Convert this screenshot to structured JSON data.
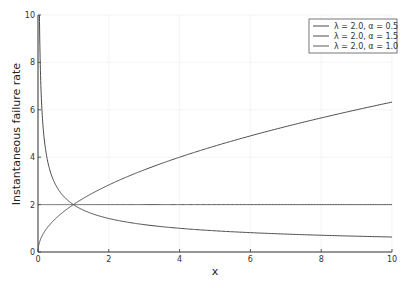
{
  "chart_data": {
    "type": "line",
    "title": "",
    "xlabel": "x",
    "ylabel": "Instantaneous failure rate",
    "xlim": [
      0,
      10
    ],
    "ylim": [
      0,
      10
    ],
    "xticks": [
      0,
      2,
      4,
      6,
      8,
      10
    ],
    "yticks": [
      0,
      2,
      4,
      6,
      8,
      10
    ],
    "grid": true,
    "legend_position": "top-right",
    "formula": "lambda * x^(alpha - 1)",
    "series": [
      {
        "name": "λ = 2.0, α = 0.5",
        "lambda": 2.0,
        "alpha": 0.5,
        "color": "#4a4a4a",
        "x": [
          0.04,
          0.1,
          0.2,
          0.4,
          0.6,
          0.8,
          1,
          1.5,
          2,
          3,
          4,
          5,
          6,
          7,
          8,
          9,
          10
        ],
        "y": [
          10,
          6.32,
          4.47,
          3.16,
          2.58,
          2.24,
          2.0,
          1.63,
          1.41,
          1.15,
          1.0,
          0.89,
          0.82,
          0.76,
          0.71,
          0.67,
          0.63
        ]
      },
      {
        "name": "λ = 2.0, α = 1.5",
        "lambda": 2.0,
        "alpha": 1.5,
        "color": "#4a4a4a",
        "x": [
          0,
          0.1,
          0.2,
          0.4,
          0.6,
          0.8,
          1,
          1.5,
          2,
          3,
          4,
          5,
          6,
          7,
          8,
          9,
          10
        ],
        "y": [
          0,
          0.63,
          0.89,
          1.26,
          1.55,
          1.79,
          2.0,
          2.45,
          2.83,
          3.46,
          4.0,
          4.47,
          4.9,
          5.29,
          5.66,
          6.0,
          6.32
        ]
      },
      {
        "name": "λ = 2.0, α = 1.0",
        "lambda": 2.0,
        "alpha": 1.0,
        "color": "#5a5a5a",
        "x": [
          0,
          10
        ],
        "y": [
          2.0,
          2.0
        ]
      }
    ]
  },
  "legend": {
    "items": [
      "λ = 2.0, α = 0.5",
      "λ = 2.0, α = 1.5",
      "λ = 2.0, α = 1.0"
    ]
  }
}
